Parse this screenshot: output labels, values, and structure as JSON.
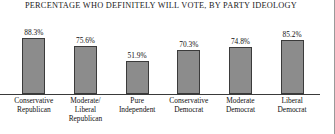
{
  "chart_data": {
    "type": "bar",
    "title": "PERCENTAGE WHO DEFINITELY WILL VOTE, BY PARTY IDEOLOGY",
    "xlabel": "",
    "ylabel": "",
    "ylim": [
      0,
      100
    ],
    "grid": false,
    "legend": "none",
    "categories": [
      "Conservative Republican",
      "Moderate/ Liberal Republican",
      "Pure Independent",
      "Conservative Democrat",
      "Moderate Democrat",
      "Liberal Democrat"
    ],
    "category_lines": [
      [
        "Conservative",
        "Republican"
      ],
      [
        "Moderate/",
        "Liberal",
        "Republican"
      ],
      [
        "Pure",
        "Independent"
      ],
      [
        "Conservative",
        "Democrat"
      ],
      [
        "Moderate",
        "Democrat"
      ],
      [
        "Liberal",
        "Democrat"
      ]
    ],
    "values": [
      88.3,
      75.6,
      51.9,
      70.3,
      74.8,
      85.2
    ],
    "value_labels": [
      "88.3%",
      "75.6%",
      "51.9%",
      "70.3%",
      "74.8%",
      "85.2%"
    ],
    "bar_color": "#8c8c8c",
    "bar_border_color": "#3b3b3b",
    "axis_color": "#3a3a3a"
  }
}
